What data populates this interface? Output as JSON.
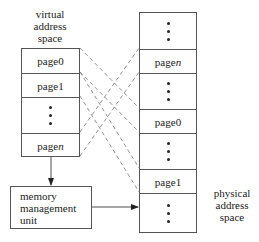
{
  "virtual_label": [
    "virtual",
    "address",
    "space"
  ],
  "physical_label": [
    "physical",
    "address",
    "space"
  ],
  "mmu_label": [
    "memory",
    "management",
    "unit"
  ],
  "virtual_space": {
    "cells": [
      {
        "type": "page",
        "prefix": "page ",
        "index": "0"
      },
      {
        "type": "page",
        "prefix": "page ",
        "index": "1"
      },
      {
        "type": "dots"
      },
      {
        "type": "page",
        "prefix": "page ",
        "index": "n",
        "italic": true
      }
    ]
  },
  "physical_space": {
    "cells": [
      {
        "type": "dots"
      },
      {
        "type": "page",
        "prefix": "page ",
        "index": "n",
        "italic": true
      },
      {
        "type": "dots"
      },
      {
        "type": "page",
        "prefix": "page ",
        "index": "0"
      },
      {
        "type": "dots"
      },
      {
        "type": "page",
        "prefix": "page ",
        "index": "1"
      },
      {
        "type": "dots"
      }
    ]
  },
  "mappings": [
    {
      "from": "page 0",
      "to": "page 0"
    },
    {
      "from": "page 1",
      "to": "page 1"
    },
    {
      "from": "page n",
      "to": "page n"
    }
  ],
  "colors": {
    "line": "#555555",
    "dash": "#777777",
    "text": "#222222"
  }
}
